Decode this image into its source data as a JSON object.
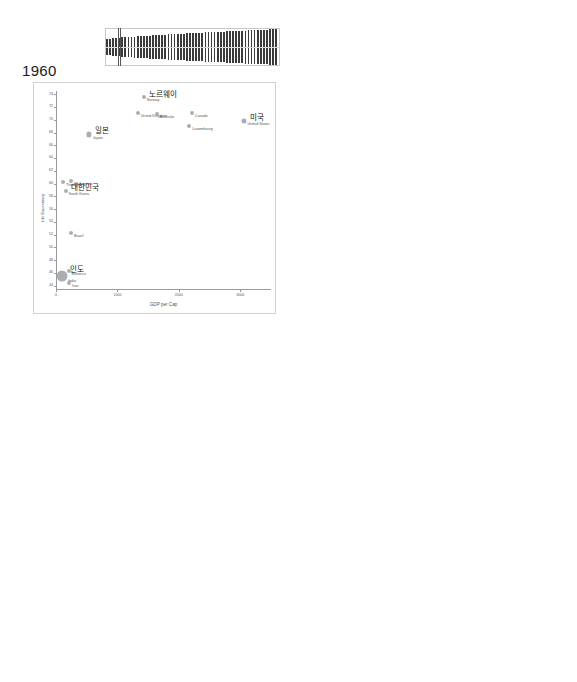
{
  "axis": {
    "xlabel": "GDP per Cap",
    "ylabel": "Life Expectancy"
  },
  "chart_data": [
    {
      "type": "scatter",
      "title": "1960",
      "xlabel": "GDP per Cap",
      "ylabel": "Life Expectancy",
      "xlim": [
        0,
        3500
      ],
      "ylim": [
        43.5,
        74.5
      ],
      "xticks": [
        "0",
        "1000",
        "2000",
        "3000"
      ],
      "yticks": [
        "44",
        "46",
        "48",
        "50",
        "52",
        "54",
        "56",
        "58",
        "60",
        "62",
        "64",
        "66",
        "68",
        "70",
        "72",
        "74"
      ],
      "brush_position": 0.07,
      "points": [
        {
          "label_en": "Norway",
          "label_ko": "노르웨이",
          "ko_big": true,
          "x": 1430,
          "y": 73.5,
          "r": 2.0
        },
        {
          "label_en": "United Kingdom",
          "label_ko": "",
          "x": 1330,
          "y": 71.1,
          "r": 2.0
        },
        {
          "label_en": "Australia",
          "label_ko": "",
          "x": 1640,
          "y": 70.9,
          "r": 2.0
        },
        {
          "label_en": "Canada",
          "label_ko": "",
          "x": 2210,
          "y": 71.1,
          "r": 2.0
        },
        {
          "label_en": "United States",
          "label_ko": "미국",
          "ko_big": true,
          "x": 3060,
          "y": 69.8,
          "r": 2.6
        },
        {
          "label_en": "Luxembourg",
          "label_ko": "",
          "x": 2170,
          "y": 69.0,
          "r": 2.0
        },
        {
          "label_en": "Japan",
          "label_ko": "일본",
          "ko_big": true,
          "x": 540,
          "y": 67.7,
          "r": 2.6
        },
        {
          "label_en": "Philippines",
          "label_ko": "",
          "x": 250,
          "y": 60.4,
          "r": 2.0
        },
        {
          "label_en": "Thailand",
          "label_ko": "",
          "x": 115,
          "y": 60.2,
          "r": 2.0
        },
        {
          "label_en": "South Korea",
          "label_ko": "대한민국",
          "ko_big": true,
          "x": 155,
          "y": 58.9,
          "r": 2.0
        },
        {
          "label_en": "Brazil",
          "label_ko": "",
          "x": 245,
          "y": 52.3,
          "r": 2.0
        },
        {
          "label_en": "Morocco",
          "label_ko": "",
          "x": 205,
          "y": 46.3,
          "r": 2.0
        },
        {
          "label_en": "India",
          "label_ko": "인도",
          "ko_big": true,
          "x": 90,
          "y": 45.5,
          "r": 5.5
        },
        {
          "label_en": "Iran",
          "label_ko": "",
          "x": 215,
          "y": 44.5,
          "r": 2.0
        }
      ]
    },
    {
      "type": "scatter",
      "title": "1970",
      "xlabel": "GDP per Cap",
      "ylabel": "Life Expectancy",
      "xlim": [
        0,
        5600
      ],
      "ylim": [
        47.2,
        75.2
      ],
      "xticks": [
        "0",
        "1000",
        "2000",
        "3000",
        "4000",
        "5000"
      ],
      "yticks": [
        "48",
        "50",
        "52",
        "54",
        "56",
        "58",
        "60",
        "62",
        "64",
        "66",
        "68",
        "70",
        "72",
        "74"
      ],
      "brush_position": 0.2,
      "points": [
        {
          "label_en": "Norway",
          "label_ko": "노르웨이",
          "ko_big": true,
          "x": 2380,
          "y": 74.3,
          "r": 2.0
        },
        {
          "label_en": "Japan",
          "label_ko": "일본",
          "ko_big": true,
          "x": 1430,
          "y": 72.5,
          "r": 2.3
        },
        {
          "label_en": "Canada",
          "label_ko": "",
          "x": 3080,
          "y": 72.6,
          "r": 2.0
        },
        {
          "label_en": "United Kingdom",
          "label_ko": "",
          "x": 1600,
          "y": 71.9,
          "r": 2.0
        },
        {
          "label_en": "Australia",
          "label_ko": "",
          "x": 2530,
          "y": 71.0,
          "r": 2.0
        },
        {
          "label_en": "United States",
          "label_ko": "미국",
          "ko_big": true,
          "x": 4230,
          "y": 71.1,
          "r": 2.8
        },
        {
          "label_en": "Kuwait",
          "label_ko": "",
          "x": 3000,
          "y": 70.3,
          "r": 2.0
        },
        {
          "label_en": "Luxembourg",
          "label_ko": "",
          "x": 3250,
          "y": 70.2,
          "r": 2.0
        },
        {
          "label_en": "Singapore",
          "label_ko": "싱가폴",
          "ko_big": true,
          "x": 850,
          "y": 68.7,
          "r": 2.0
        },
        {
          "label_en": "Thailand",
          "label_ko": "",
          "x": 230,
          "y": 63.9,
          "r": 2.0
        },
        {
          "label_en": "South Korea",
          "label_ko": "대한민국",
          "ko_big": true,
          "x": 330,
          "y": 63.2,
          "r": 2.0
        },
        {
          "label_en": "Philippines",
          "label_ko": "",
          "x": 300,
          "y": 62.8,
          "r": 2.0
        },
        {
          "label_en": "El Salvador",
          "label_ko": "",
          "x": 290,
          "y": 57.8,
          "r": 2.0
        },
        {
          "label_en": "Brazil",
          "label_ko": "",
          "x": 400,
          "y": 57.0,
          "r": 2.0
        },
        {
          "label_en": "Morocco",
          "label_ko": "",
          "x": 320,
          "y": 54.2,
          "r": 2.0
        },
        {
          "label_en": "Egypt",
          "label_ko": "",
          "x": 260,
          "y": 52.0,
          "r": 2.0
        },
        {
          "label_en": "India",
          "label_ko": "인도",
          "ko_big": true,
          "x": 160,
          "y": 49.3,
          "r": 5.5
        },
        {
          "label_en": "Afghanistan",
          "label_ko": "",
          "x": 250,
          "y": 47.8,
          "r": 2.0
        }
      ]
    },
    {
      "type": "scatter",
      "title": "1990",
      "xlabel": "GDP per Cap",
      "ylabel": "Life Expectancy",
      "xlim": [
        0,
        38000
      ],
      "ylim": [
        59.3,
        79.3
      ],
      "xticks": [
        "0",
        "10000",
        "20000",
        "30000"
      ],
      "yticks": [
        "60",
        "62",
        "64",
        "66",
        "68",
        "70",
        "72",
        "74",
        "76",
        "78"
      ],
      "brush_position": 0.49,
      "points": [
        {
          "label_en": "Japan",
          "label_ko": "일본",
          "ko_big": true,
          "x": 22500,
          "y": 78.8,
          "r": 2.2
        },
        {
          "label_en": "Canada",
          "label_ko": "",
          "x": 19700,
          "y": 77.4,
          "r": 2.0
        },
        {
          "label_en": "Australia",
          "label_ko": "",
          "x": 17300,
          "y": 76.9,
          "r": 2.0
        },
        {
          "label_en": "Norway",
          "label_ko": "노르웨이",
          "ko_big": true,
          "x": 25400,
          "y": 76.9,
          "r": 2.0
        },
        {
          "label_en": "Singapore",
          "label_ko": "",
          "x": 11200,
          "y": 75.4,
          "r": 2.0
        },
        {
          "label_en": "United Kingdom",
          "label_ko": "",
          "x": 18000,
          "y": 75.7,
          "r": 2.0
        },
        {
          "label_en": "United States",
          "label_ko": "미국",
          "ko_big": true,
          "x": 21000,
          "y": 75.4,
          "r": 2.6
        },
        {
          "label_en": "Luxembourg",
          "label_ko": "룩셈부르크",
          "ko_big": true,
          "x": 30000,
          "y": 75.3,
          "r": 2.0
        },
        {
          "label_en": "Kuwait",
          "label_ko": "",
          "x": 9200,
          "y": 74.5,
          "r": 2.0
        },
        {
          "label_en": "South Korea",
          "label_ko": "대한민국",
          "ko_big": true,
          "x": 6600,
          "y": 71.8,
          "r": 2.0
        },
        {
          "label_en": "Thailand",
          "label_ko": "",
          "x": 2800,
          "y": 70.8,
          "r": 2.0
        },
        {
          "label_en": "El Salvador",
          "label_ko": "",
          "x": 2200,
          "y": 69.9,
          "r": 2.0
        },
        {
          "label_en": "China",
          "label_ko": "중국",
          "ko_big": true,
          "x": 1100,
          "y": 68.9,
          "r": 5.5
        },
        {
          "label_en": "Philippines",
          "label_ko": "",
          "x": 2100,
          "y": 68.6,
          "r": 2.0
        },
        {
          "label_en": "Brazil",
          "label_ko": "",
          "x": 3200,
          "y": 67.6,
          "r": 2.2
        },
        {
          "label_en": "Morocco",
          "label_ko": "",
          "x": 2500,
          "y": 67.2,
          "r": 2.0
        },
        {
          "label_en": "Indonesia",
          "label_ko": "",
          "x": 1800,
          "y": 64.0,
          "r": 2.6
        },
        {
          "label_en": "Egypt",
          "label_ko": "",
          "x": 2600,
          "y": 64.0,
          "r": 2.0
        },
        {
          "label_en": "India",
          "label_ko": "인도",
          "ko_big": true,
          "x": 1200,
          "y": 59.9,
          "r": 5.5
        }
      ]
    },
    {
      "type": "scatter",
      "title": "2000",
      "xlabel": "GDP per Cap",
      "ylabel": "Life Expectancy",
      "xlim": [
        0,
        55000
      ],
      "ylim": [
        57.6,
        82.6
      ],
      "xticks": [
        "0",
        "10000",
        "20000",
        "30000",
        "40000",
        "50000"
      ],
      "yticks": [
        "58",
        "60",
        "62",
        "64",
        "66",
        "68",
        "70",
        "72",
        "74",
        "76",
        "78",
        "80",
        "82"
      ],
      "brush_position": 0.62,
      "points": [
        {
          "label_en": "Japan",
          "label_ko": "일본",
          "ko_big": true,
          "x": 33000,
          "y": 81.7,
          "r": 2.2
        },
        {
          "label_en": "Australia",
          "label_ko": "",
          "x": 20500,
          "y": 79.8,
          "r": 2.0
        },
        {
          "label_en": "Canada",
          "label_ko": "",
          "x": 22500,
          "y": 79.6,
          "r": 2.0
        },
        {
          "label_en": "Singapore",
          "label_ko": "",
          "x": 23500,
          "y": 79.4,
          "r": 2.0
        },
        {
          "label_en": "Norway",
          "label_ko": "노르웨이",
          "ko_big": true,
          "x": 32000,
          "y": 79.2,
          "r": 2.0
        },
        {
          "label_en": "United Kingdom",
          "label_ko": "",
          "x": 27000,
          "y": 78.6,
          "r": 2.0
        },
        {
          "label_en": "Luxembourg",
          "label_ko": "룩셈부르크",
          "ko_big": true,
          "x": 45000,
          "y": 78.5,
          "r": 2.0
        },
        {
          "label_en": "Kuwait",
          "label_ko": "",
          "x": 15500,
          "y": 78.2,
          "r": 2.0
        },
        {
          "label_en": "United States",
          "label_ko": "미국",
          "ko_big": true,
          "x": 31000,
          "y": 77.6,
          "r": 2.6
        },
        {
          "label_en": "South Korea",
          "label_ko": "대한민국",
          "ko_big": true,
          "x": 11500,
          "y": 76.9,
          "r": 2.0
        },
        {
          "label_en": "El Salvador",
          "label_ko": "",
          "x": 3300,
          "y": 72.6,
          "r": 2.0
        },
        {
          "label_en": "Thailand",
          "label_ko": "",
          "x": 3600,
          "y": 71.9,
          "r": 2.0
        },
        {
          "label_en": "China",
          "label_ko": "중국",
          "ko_big": true,
          "x": 2300,
          "y": 71.7,
          "r": 5.8
        },
        {
          "label_en": "Brazil",
          "label_ko": "",
          "x": 4200,
          "y": 71.1,
          "r": 2.4
        },
        {
          "label_en": "Philippines",
          "label_ko": "",
          "x": 2800,
          "y": 70.2,
          "r": 2.2
        },
        {
          "label_en": "Morocco",
          "label_ko": "",
          "x": 3100,
          "y": 69.3,
          "r": 2.0
        },
        {
          "label_en": "United Arab Emirates",
          "label_ko": "아랍 에미리트",
          "ko_big": true,
          "x": 38500,
          "y": 69.4,
          "r": 2.0
        },
        {
          "label_en": "Egypt",
          "label_ko": "",
          "x": 3000,
          "y": 68.4,
          "r": 2.0
        },
        {
          "label_en": "Indonesia",
          "label_ko": "",
          "x": 2400,
          "y": 66.8,
          "r": 2.6
        },
        {
          "label_en": "India",
          "label_ko": "인도",
          "ko_big": true,
          "x": 2000,
          "y": 61.2,
          "r": 5.5
        },
        {
          "label_en": "Mongolia",
          "label_ko": "",
          "x": 2600,
          "y": 58.2,
          "r": 2.0
        }
      ]
    }
  ]
}
